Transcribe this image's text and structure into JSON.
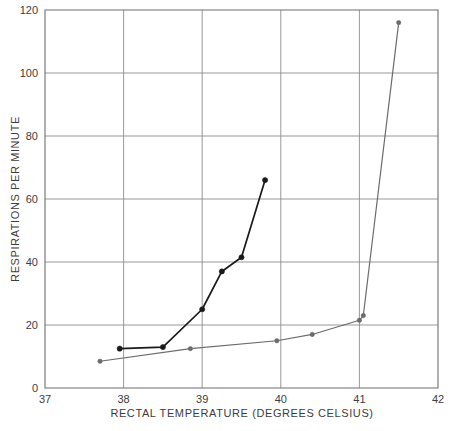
{
  "chart_data": {
    "type": "line",
    "title": "",
    "subtitle": "",
    "xlabel": "RECTAL TEMPERATURE (DEGREES CELSIUS)",
    "ylabel": "RESPIRATIONS PER MINUTE",
    "xlim": [
      37,
      42
    ],
    "ylim": [
      0,
      120
    ],
    "xticks": [
      37,
      38,
      39,
      40,
      41,
      42
    ],
    "yticks": [
      0,
      20,
      40,
      60,
      80,
      100,
      120
    ],
    "xtick_labels": [
      "37",
      "38",
      "39",
      "40",
      "41",
      "42"
    ],
    "ytick_labels": [
      "0",
      "20",
      "40",
      "60",
      "80",
      "100",
      "120"
    ],
    "grid": true,
    "legend": "none",
    "markers": "filled-circle",
    "series": [
      {
        "name": "steep-early-response",
        "color": "#1a1a1a",
        "line_width": 1.7,
        "marker_size": 2.6,
        "points": [
          {
            "x": 37.95,
            "y": 12.5
          },
          {
            "x": 38.5,
            "y": 13.0
          },
          {
            "x": 39.0,
            "y": 25.0
          },
          {
            "x": 39.25,
            "y": 37.0
          },
          {
            "x": 39.5,
            "y": 41.5
          },
          {
            "x": 39.8,
            "y": 66.0
          }
        ]
      },
      {
        "name": "delayed-response",
        "color": "#6b6b6b",
        "line_width": 1.2,
        "marker_size": 2.2,
        "points": [
          {
            "x": 37.7,
            "y": 8.5
          },
          {
            "x": 38.85,
            "y": 12.5
          },
          {
            "x": 39.95,
            "y": 15.0
          },
          {
            "x": 40.4,
            "y": 17.0
          },
          {
            "x": 41.0,
            "y": 21.5
          },
          {
            "x": 41.05,
            "y": 23.0
          },
          {
            "x": 41.5,
            "y": 116.0
          }
        ]
      }
    ]
  }
}
